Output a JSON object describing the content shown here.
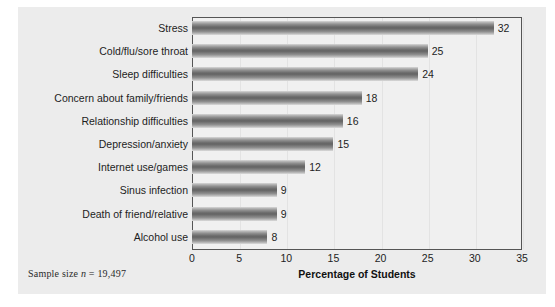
{
  "chart_data": {
    "type": "bar",
    "orientation": "horizontal",
    "title": "",
    "xlabel": "Percentage of Students",
    "ylabel": "",
    "xlim": [
      0,
      35
    ],
    "xticks": [
      0,
      5,
      10,
      15,
      20,
      25,
      30,
      35
    ],
    "grid": true,
    "legend": null,
    "categories": [
      "Stress",
      "Cold/flu/sore throat",
      "Sleep difficulties",
      "Concern about family/friends",
      "Relationship difficulties",
      "Depression/anxiety",
      "Internet use/games",
      "Sinus infection",
      "Death of friend/relative",
      "Alcohol use"
    ],
    "values": [
      32,
      25,
      24,
      18,
      16,
      15,
      12,
      9,
      9,
      8
    ],
    "value_labels": [
      "32",
      "25",
      "24",
      "18",
      "16",
      "15",
      "12",
      "9",
      "9",
      "8"
    ],
    "annotation": {
      "prefix": "Sample size ",
      "symbol": "n",
      "suffix": " = 19,497",
      "full_text": "Sample size n = 19,497"
    },
    "colors": {
      "panel_background": "#ececec",
      "plot_background": "#f0f0f0",
      "bar_light": "#d8d8d8",
      "bar_dark": "#636363",
      "axis_line": "#555555",
      "gridline": "#e3e3e3",
      "text": "#1d1d1d"
    }
  }
}
